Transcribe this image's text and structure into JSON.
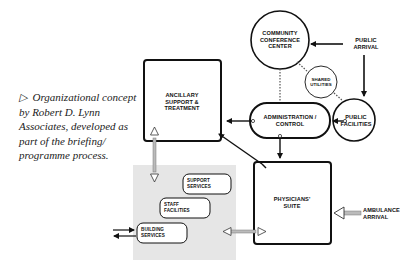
{
  "caption": {
    "marker": "▷",
    "lines": [
      "Organizational concept",
      "by Robert D. Lynn",
      "Associates, developed as",
      "part of the briefing/",
      "programme process."
    ]
  },
  "nodes": {
    "community_conference_center": {
      "lines": [
        "COMMUNITY",
        "CONFERENCE",
        "CENTER"
      ],
      "shape": "circle"
    },
    "public_arrival": {
      "lines": [
        "PUBLIC",
        "ARRIVAL"
      ],
      "shape": "text"
    },
    "shared_utilities": {
      "lines": [
        "SHARED",
        "UTILITIES"
      ],
      "shape": "circle"
    },
    "public_facilities": {
      "lines": [
        "PUBLIC",
        "FACILITIES"
      ],
      "shape": "circle"
    },
    "administration_control": {
      "lines": [
        "ADMINISTRATION /",
        "CONTROL"
      ],
      "shape": "pill"
    },
    "ancillary_support_treatment": {
      "lines": [
        "ANCILLARY",
        "SUPPORT &",
        "TREATMENT"
      ],
      "shape": "square"
    },
    "physicians_suite": {
      "lines": [
        "PHYSICIANS'",
        "SUITE"
      ],
      "shape": "square"
    },
    "ambulance_arrival": {
      "lines": [
        "AMBULANCE",
        "ARRIVAL"
      ],
      "shape": "text"
    },
    "support_services": {
      "lines": [
        "SUPPORT",
        "SERVICES"
      ],
      "shape": "rounded-rect"
    },
    "staff_facilities": {
      "lines": [
        "STAFF",
        "FACILITIES"
      ],
      "shape": "rounded-rect"
    },
    "building_services": {
      "lines": [
        "BUILDING",
        "SERVICES"
      ],
      "shape": "rounded-rect"
    }
  },
  "colors": {
    "line": "#111111",
    "service_zone": "#e6e6e6",
    "caption_text": "#222222"
  }
}
